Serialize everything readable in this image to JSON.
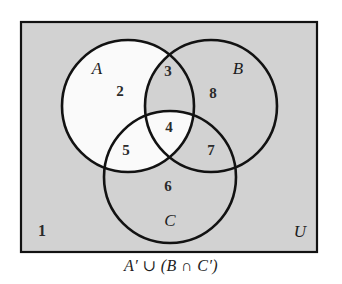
{
  "figure": {
    "type": "venn-diagram-three-set",
    "caption": "A′ ∪ (B ∩ C′)",
    "universe_label": "U",
    "outside_region_number": "1",
    "colors": {
      "universe_fill": "#d2d2d2",
      "shaded_fill": "#d2d2d2",
      "unshaded_fill": "#fafafa",
      "stroke": "#121212",
      "text": "#2b2b2b",
      "page_background": "#ffffff"
    },
    "rect": {
      "x": 21,
      "y": 22,
      "width": 296,
      "height": 230
    },
    "set_labels": [
      {
        "name": "A",
        "text": "A",
        "x": 97,
        "y": 70
      },
      {
        "name": "B",
        "text": "B",
        "x": 238,
        "y": 70
      },
      {
        "name": "C",
        "text": "C",
        "x": 170,
        "y": 222
      }
    ],
    "circles": [
      {
        "name": "A",
        "cx": 128,
        "cy": 106,
        "r": 66
      },
      {
        "name": "B",
        "cx": 211,
        "cy": 106,
        "r": 66
      },
      {
        "name": "C",
        "cx": 170,
        "cy": 177,
        "r": 66
      }
    ],
    "regions": [
      {
        "number": "1",
        "set_expression": "outside all sets",
        "shaded": true,
        "x": 42,
        "y": 232
      },
      {
        "number": "2",
        "set_expression": "A only",
        "shaded": false,
        "x": 120,
        "y": 93
      },
      {
        "number": "3",
        "set_expression": "A ∩ B, not C",
        "shaded": true,
        "x": 168,
        "y": 73
      },
      {
        "number": "4",
        "set_expression": "A ∩ B ∩ C",
        "shaded": false,
        "x": 169,
        "y": 129
      },
      {
        "number": "5",
        "set_expression": "A ∩ C, not B",
        "shaded": false,
        "x": 126,
        "y": 152
      },
      {
        "number": "6",
        "set_expression": "C only",
        "shaded": true,
        "x": 168,
        "y": 188
      },
      {
        "number": "7",
        "set_expression": "B ∩ C, not A",
        "shaded": true,
        "x": 211,
        "y": 152
      },
      {
        "number": "8",
        "set_expression": "B only",
        "shaded": true,
        "x": 213,
        "y": 95
      }
    ]
  }
}
